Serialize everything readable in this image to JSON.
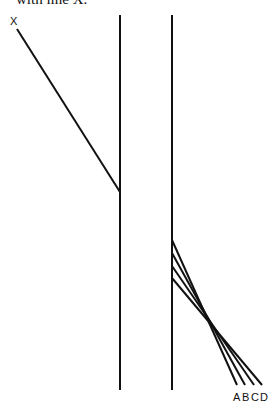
{
  "caption": "with line X.",
  "diagram": {
    "line_x_label": "X",
    "parallel_labels": [
      "A",
      "B",
      "C",
      "D"
    ],
    "stroke_color": "#111111",
    "vertical_lines": [
      {
        "x": 120,
        "y1": 15,
        "y2": 390
      },
      {
        "x": 172,
        "y1": 15,
        "y2": 390
      }
    ],
    "line_x": {
      "x1": 17,
      "y1": 29,
      "x2": 120,
      "y2": 192
    },
    "candidate_lines": [
      {
        "label": "A",
        "x1": 172,
        "y1": 240,
        "x2": 237,
        "y2": 385
      },
      {
        "label": "B",
        "x1": 172,
        "y1": 253,
        "x2": 245,
        "y2": 385
      },
      {
        "label": "C",
        "x1": 172,
        "y1": 266,
        "x2": 254,
        "y2": 385
      },
      {
        "label": "D",
        "x1": 172,
        "y1": 278,
        "x2": 262,
        "y2": 385
      }
    ]
  }
}
